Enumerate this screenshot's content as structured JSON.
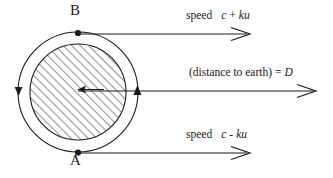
{
  "figure": {
    "type": "physics-schematic",
    "background_color": "#ffffff",
    "stroke_color": "#1a1a1a"
  },
  "labels": {
    "point_b": "B",
    "point_a": "A",
    "speed_top_word": "speed",
    "speed_top_expr_c": "c",
    "speed_top_operator": "+",
    "speed_top_expr_ku": "ku",
    "speed_bottom_word": "speed",
    "speed_bottom_expr_c": "c",
    "speed_bottom_operator": "-",
    "speed_bottom_expr_ku": "ku",
    "distance_text": "(distance to earth) =",
    "distance_var": "D"
  },
  "geometry": {
    "center_x": 78,
    "center_y": 92,
    "outer_radius": 60,
    "inner_radius": 48,
    "hatch_angle_deg": 45,
    "point_b_x": 78,
    "point_b_y": 32,
    "point_a_x": 78,
    "point_a_y": 152,
    "arrow_top_y": 34,
    "arrow_top_end_x": 250,
    "arrow_mid_y": 92,
    "arrow_mid_end_x": 316,
    "arrow_bottom_y": 153,
    "arrow_bottom_end_x": 250,
    "rotation_arrow_left": "up",
    "rotation_arrow_right": "down"
  },
  "text_positions": {
    "point_b_left": 70,
    "point_b_top": 4,
    "point_a_left": 70,
    "point_a_top": 154,
    "speed_top_left": 186,
    "speed_top_top": 9,
    "distance_left": 189,
    "distance_top": 66,
    "speed_bottom_left": 186,
    "speed_bottom_top": 128
  }
}
